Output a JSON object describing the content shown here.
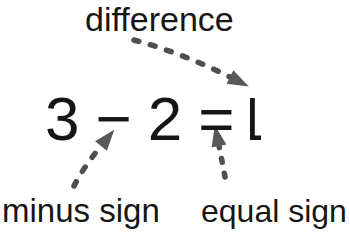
{
  "labels": {
    "difference": "difference",
    "minus_sign": "minus sign",
    "equal_sign": "equal sign"
  },
  "equation": {
    "text": "3 − 2 = 1",
    "parts": [
      "3",
      "−",
      "2",
      "=",
      "1"
    ],
    "minuend": "3",
    "subtrahend": "2",
    "result": "1"
  },
  "arrows": [
    {
      "name": "difference-arrow",
      "from": "difference",
      "to": "1",
      "style": "dashed"
    },
    {
      "name": "minus-sign-arrow",
      "from": "minus sign",
      "to": "−",
      "style": "dashed"
    },
    {
      "name": "equal-sign-arrow",
      "from": "equal sign",
      "to": "=",
      "style": "dashed"
    }
  ],
  "colors": {
    "background": "#ffffff",
    "text": "#161616",
    "arrow_dash": "#4f4f4f",
    "arrow_head": "#585858"
  }
}
